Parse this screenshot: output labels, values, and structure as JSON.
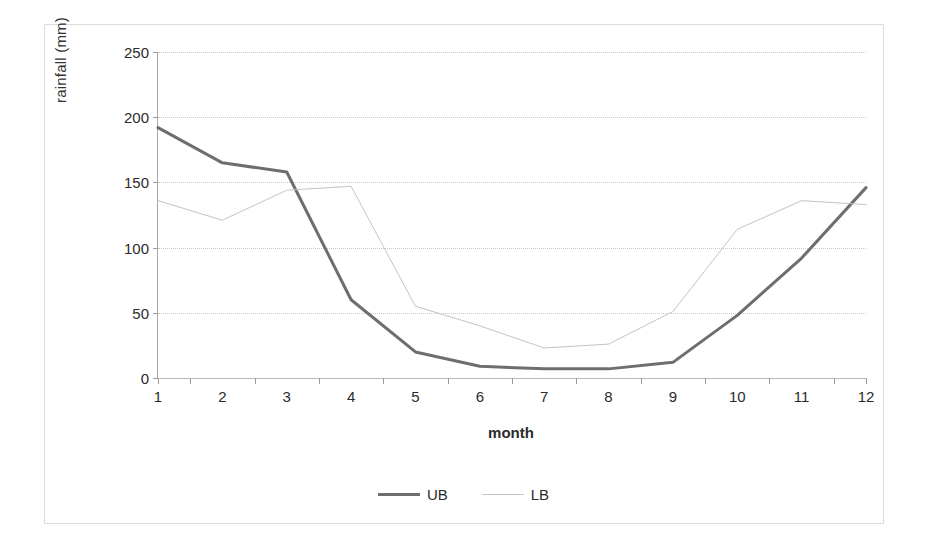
{
  "chart_data": {
    "type": "line",
    "title": "",
    "xlabel": "month",
    "ylabel": "rainfall (mm)",
    "categories": [
      "1",
      "2",
      "3",
      "4",
      "5",
      "6",
      "7",
      "8",
      "9",
      "10",
      "11",
      "12"
    ],
    "x": [
      1,
      2,
      3,
      4,
      5,
      6,
      7,
      8,
      9,
      10,
      11,
      12
    ],
    "xlim": [
      1,
      12
    ],
    "ylim": [
      0,
      250
    ],
    "yticks": [
      0,
      50,
      100,
      150,
      200,
      250
    ],
    "ytick_labels": [
      "0",
      "50",
      "100",
      "150",
      "200",
      "250"
    ],
    "grid": "horizontal-dotted",
    "legend_position": "bottom-center",
    "series": [
      {
        "name": "UB",
        "color": "#6e6e6e",
        "line_width": 3,
        "values": [
          192,
          165,
          158,
          60,
          20,
          9,
          7,
          7,
          12,
          48,
          92,
          146
        ]
      },
      {
        "name": "LB",
        "color": "#c4c4c4",
        "line_width": 1,
        "values": [
          136,
          121,
          144,
          147,
          55,
          40,
          23,
          26,
          51,
          114,
          136,
          133
        ]
      }
    ]
  },
  "legend": {
    "items": [
      {
        "label": "UB",
        "swatch": "ub"
      },
      {
        "label": "LB",
        "swatch": "lb"
      }
    ]
  }
}
